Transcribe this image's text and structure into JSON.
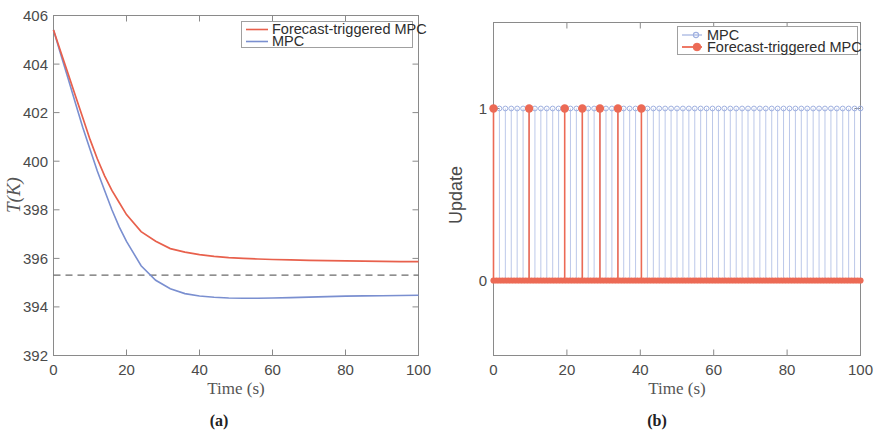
{
  "figure": {
    "panels": [
      {
        "id": "a",
        "caption": "(a)",
        "xlabel": "Time (s)",
        "ylabel": "T(K)",
        "xticks": [
          "0",
          "20",
          "40",
          "60",
          "80",
          "100"
        ],
        "yticks": [
          "392",
          "394",
          "396",
          "398",
          "400",
          "402",
          "404",
          "406"
        ],
        "legend": [
          {
            "label": "Forecast-triggered MPC",
            "color": "#e8604c",
            "marker": "none"
          },
          {
            "label": "MPC",
            "color": "#7a8fd0",
            "marker": "none"
          }
        ]
      },
      {
        "id": "b",
        "caption": "(b)",
        "xlabel": "Time (s)",
        "ylabel": "Update",
        "xticks": [
          "0",
          "20",
          "40",
          "60",
          "80",
          "100"
        ],
        "yticks": [
          "0",
          "1"
        ],
        "legend": [
          {
            "label": "MPC",
            "color": "#9fb0e0",
            "marker": "circle-open"
          },
          {
            "label": "Forecast-triggered MPC",
            "color": "#ec6a55",
            "marker": "circle-filled"
          }
        ]
      }
    ]
  },
  "colors": {
    "forecast_red": "#e8604c",
    "mpc_blue": "#7a8fd0",
    "mpc_blue_light": "#9fb0e0",
    "setpoint_dashed": "#6b6b6b",
    "axis": "#8a8a8a"
  },
  "chart_data": [
    {
      "type": "line",
      "panel": "a",
      "title": "",
      "xlabel": "Time (s)",
      "ylabel": "T(K)",
      "xlim": [
        0,
        100
      ],
      "ylim": [
        392,
        406
      ],
      "xticks": [
        0,
        20,
        40,
        60,
        80,
        100
      ],
      "yticks": [
        392,
        394,
        396,
        398,
        400,
        402,
        404,
        406
      ],
      "grid": false,
      "legend_position": "top-right",
      "annotations": [
        {
          "type": "hline",
          "y": 395.3,
          "style": "dashed",
          "color": "#6b6b6b",
          "label": "setpoint"
        }
      ],
      "series": [
        {
          "name": "Forecast-triggered MPC",
          "color": "#e8604c",
          "x": [
            0,
            2,
            4,
            6,
            8,
            10,
            12,
            14,
            16,
            18,
            20,
            24,
            28,
            32,
            36,
            40,
            44,
            48,
            52,
            56,
            60,
            65,
            70,
            75,
            80,
            85,
            90,
            95,
            100
          ],
          "y": [
            405.0,
            404.1,
            403.2,
            402.3,
            401.4,
            400.5,
            399.7,
            399.0,
            398.4,
            397.9,
            397.4,
            396.7,
            396.3,
            396.0,
            395.85,
            395.75,
            395.68,
            395.63,
            395.6,
            395.57,
            395.55,
            395.53,
            395.51,
            395.5,
            395.49,
            395.48,
            395.47,
            395.46,
            395.46
          ]
        },
        {
          "name": "MPC",
          "color": "#7a8fd0",
          "x": [
            0,
            2,
            4,
            6,
            8,
            10,
            12,
            14,
            16,
            18,
            20,
            24,
            28,
            32,
            36,
            40,
            44,
            48,
            52,
            56,
            60,
            65,
            70,
            75,
            80,
            85,
            90,
            95,
            100
          ],
          "y": [
            405.0,
            404.0,
            403.0,
            402.0,
            401.0,
            400.1,
            399.2,
            398.4,
            397.6,
            396.9,
            396.3,
            395.3,
            394.7,
            394.35,
            394.15,
            394.05,
            394.0,
            393.97,
            393.96,
            393.96,
            393.97,
            393.99,
            394.01,
            394.03,
            394.05,
            394.06,
            394.07,
            394.08,
            394.09
          ]
        }
      ]
    },
    {
      "type": "scatter",
      "panel": "b",
      "title": "",
      "xlabel": "Time (s)",
      "ylabel": "Update",
      "xlim": [
        0,
        100
      ],
      "ylim": [
        -0.45,
        1.45
      ],
      "xticks": [
        0,
        20,
        40,
        60,
        80,
        100
      ],
      "yticks": [
        0,
        1
      ],
      "grid": false,
      "legend_position": "top-right",
      "series": [
        {
          "name": "MPC",
          "color": "#9fb0e0",
          "marker": "circle-open",
          "description": "Stem plot: update = 1 at every periodic sampling instant",
          "x": [
            0,
            1.61,
            3.23,
            4.84,
            6.45,
            8.06,
            9.68,
            11.29,
            12.9,
            14.52,
            16.13,
            17.74,
            19.35,
            20.97,
            22.58,
            24.19,
            25.81,
            27.42,
            29.03,
            30.65,
            32.26,
            33.87,
            35.48,
            37.1,
            38.71,
            40.32,
            41.94,
            43.55,
            45.16,
            46.77,
            48.39,
            50.0,
            51.61,
            53.23,
            54.84,
            56.45,
            58.06,
            59.68,
            61.29,
            62.9,
            64.52,
            66.13,
            67.74,
            69.35,
            70.97,
            72.58,
            74.19,
            75.81,
            77.42,
            79.03,
            80.65,
            82.26,
            83.87,
            85.48,
            87.1,
            88.71,
            90.32,
            91.94,
            93.55,
            95.16,
            96.77,
            98.39,
            100
          ],
          "y": 1
        },
        {
          "name": "Forecast-triggered MPC",
          "color": "#ec6a55",
          "marker": "circle-filled",
          "description": "Stem plot: update = 1 only at forecast-triggered instants, 0 elsewhere",
          "trigger_x": [
            0,
            9.7,
            19.4,
            24.2,
            29.0,
            33.9,
            40.3
          ],
          "trigger_y": 1,
          "baseline_y": 0
        }
      ]
    }
  ]
}
